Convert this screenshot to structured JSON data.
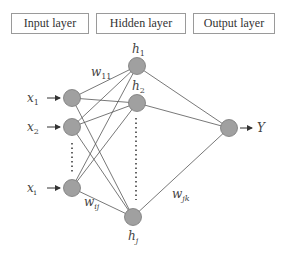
{
  "header": {
    "layers": [
      {
        "label": "Input layer"
      },
      {
        "label": "Hidden layer"
      },
      {
        "label": "Output layer"
      }
    ]
  },
  "network": {
    "node_color": "#a0a0a0",
    "edge_color": "#555555",
    "input_nodes": [
      {
        "label": "x",
        "sub": "1"
      },
      {
        "label": "x",
        "sub": "2"
      },
      {
        "label": "x",
        "sub": "i"
      }
    ],
    "hidden_nodes": [
      {
        "label": "h",
        "sub": "1"
      },
      {
        "label": "h",
        "sub": "2"
      },
      {
        "label": "h",
        "sub": "j"
      }
    ],
    "output_node": {
      "label": "Y"
    },
    "weights": {
      "w11": {
        "label": "w",
        "sub": "11"
      },
      "wij": {
        "label": "w",
        "sub": "ij"
      },
      "wjk": {
        "label": "w",
        "sub": "jk"
      }
    }
  }
}
